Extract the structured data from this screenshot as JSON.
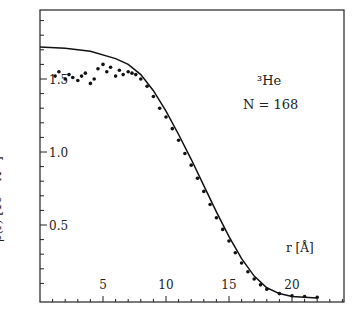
{
  "chart_data": {
    "type": "line",
    "title": "",
    "xlabel": "r [Å]",
    "ylabel": "ρ(r) [10⁻² Å⁻³]",
    "xlim": [
      0,
      24
    ],
    "ylim": [
      0,
      2.0
    ],
    "xticks": [
      "5",
      "10",
      "15",
      "20"
    ],
    "yticks": [
      "0.5",
      "1.0",
      "1.5"
    ],
    "annotation": {
      "isotope": "³He",
      "n_label": "N = 168"
    },
    "series": [
      {
        "name": "theory (solid line)",
        "style": "line",
        "x": [
          0,
          2,
          4,
          6,
          7,
          8,
          9,
          10,
          11,
          12,
          13,
          14,
          15,
          16,
          17,
          18,
          19,
          20,
          21,
          22
        ],
        "y": [
          1.72,
          1.71,
          1.69,
          1.64,
          1.6,
          1.53,
          1.42,
          1.28,
          1.12,
          0.95,
          0.77,
          0.59,
          0.42,
          0.27,
          0.15,
          0.07,
          0.03,
          0.01,
          0.005,
          0.0
        ]
      },
      {
        "name": "simulation (points)",
        "style": "scatter",
        "x": [
          1.2,
          1.5,
          2.0,
          2.3,
          2.6,
          3.0,
          3.3,
          3.6,
          4.0,
          4.3,
          4.6,
          5.0,
          5.3,
          5.6,
          6.0,
          6.3,
          6.6,
          7.0,
          7.3,
          7.6,
          8.0,
          8.5,
          9.0,
          9.5,
          10,
          10.5,
          11,
          11.5,
          12,
          12.5,
          13,
          13.5,
          14,
          14.5,
          15,
          15.5,
          16,
          16.5,
          17,
          17.5,
          18,
          19,
          20,
          21,
          22
        ],
        "y": [
          1.52,
          1.55,
          1.5,
          1.53,
          1.51,
          1.49,
          1.52,
          1.54,
          1.47,
          1.5,
          1.57,
          1.6,
          1.55,
          1.58,
          1.52,
          1.56,
          1.53,
          1.55,
          1.54,
          1.53,
          1.5,
          1.45,
          1.38,
          1.3,
          1.24,
          1.16,
          1.08,
          0.99,
          0.91,
          0.82,
          0.73,
          0.64,
          0.55,
          0.47,
          0.39,
          0.31,
          0.24,
          0.18,
          0.13,
          0.09,
          0.06,
          0.03,
          0.015,
          0.01,
          0.005
        ]
      }
    ],
    "grid": false,
    "legend": "none"
  }
}
